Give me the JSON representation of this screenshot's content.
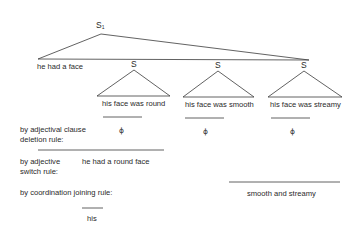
{
  "tree": {
    "root_label": "S",
    "root_subscript": "1",
    "root_phrase": "he had a face",
    "embedded": [
      {
        "label": "S",
        "sentence": "his face was round",
        "deleted": "ϕ"
      },
      {
        "label": "S",
        "sentence": "his face was smooth",
        "deleted": "ϕ"
      },
      {
        "label": "S",
        "sentence": "his face was streamy",
        "deleted": "ϕ"
      }
    ]
  },
  "rules": {
    "adjectival_clause_deletion": {
      "line1": "by adjectival clause",
      "line2": "deletion rule:"
    },
    "adjective_switch": {
      "line1": "by adjective",
      "line2": "switch rule:",
      "result": "he had a round face"
    },
    "coordination_joining": {
      "label": "by coordination joining rule:",
      "result_right": "smooth and streamy",
      "result_left": "his"
    }
  }
}
